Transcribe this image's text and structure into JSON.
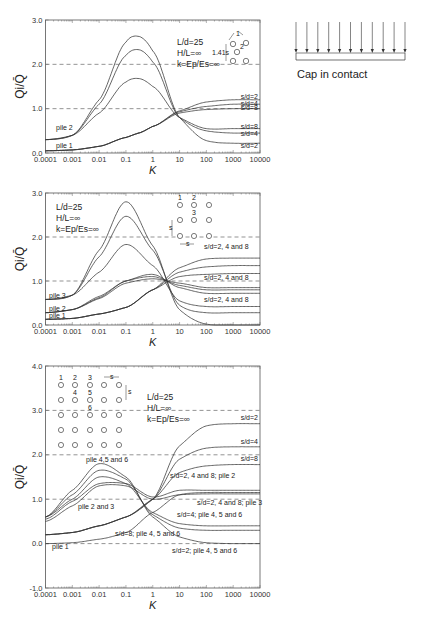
{
  "legend_box": {
    "caption": "Cap in contact"
  },
  "chart_data": [
    {
      "type": "line",
      "panel": "top (3-pile triangular group)",
      "title": "",
      "xlabel": "K",
      "ylabel": "Qi/Q̄",
      "xscale": "log",
      "xlim": [
        0.0001,
        10000
      ],
      "ylim": [
        0.0,
        3.0
      ],
      "x_ticks": [
        "0.0001",
        "0.001",
        "0.01",
        "0.1",
        "1",
        "10",
        "100",
        "1000",
        "10000"
      ],
      "y_ticks": [
        "0.0",
        "1.0",
        "2.0",
        "3.0"
      ],
      "grid": "dashed at 1.0 and 2.0",
      "parameters": [
        "L/d=25",
        "H/L=∞",
        "k=Ep/Es=∞"
      ],
      "diagram_label": "1.41s",
      "annotations": [
        "pile 2",
        "pile 1",
        "s/d=2",
        "s/d=4",
        "s/d=8",
        "s/d=8",
        "s/d=4",
        "s/d=2"
      ],
      "x": [
        0.0001,
        0.001,
        0.01,
        0.1,
        0.3,
        1,
        10,
        100,
        1000,
        10000
      ],
      "series": [
        {
          "name": "pile 2, s/d=2",
          "values": [
            0.3,
            0.4,
            1.2,
            2.5,
            2.63,
            2.3,
            0.8,
            0.28,
            0.22,
            0.22
          ]
        },
        {
          "name": "pile 2, s/d=4",
          "values": [
            0.3,
            0.4,
            1.1,
            2.2,
            2.33,
            2.05,
            0.8,
            0.5,
            0.45,
            0.45
          ]
        },
        {
          "name": "pile 2, s/d=8",
          "values": [
            0.3,
            0.4,
            0.9,
            1.6,
            1.68,
            1.5,
            0.8,
            0.55,
            0.55,
            0.55
          ]
        },
        {
          "name": "pile 1, s/d=2",
          "values": [
            0.05,
            0.07,
            0.15,
            0.35,
            0.45,
            0.6,
            0.95,
            1.15,
            1.2,
            1.2
          ]
        },
        {
          "name": "pile 1, s/d=4",
          "values": [
            0.05,
            0.07,
            0.15,
            0.35,
            0.45,
            0.6,
            0.93,
            1.05,
            1.1,
            1.1
          ]
        },
        {
          "name": "pile 1, s/d=8",
          "values": [
            0.05,
            0.07,
            0.15,
            0.35,
            0.45,
            0.6,
            0.9,
            0.98,
            1.0,
            1.0
          ]
        }
      ]
    },
    {
      "type": "line",
      "panel": "middle (3x3 pile group)",
      "title": "",
      "xlabel": "K",
      "ylabel": "Qi/Q̄",
      "xscale": "log",
      "xlim": [
        0.0001,
        10000
      ],
      "ylim": [
        0.0,
        3.0
      ],
      "x_ticks": [
        "0.0001",
        "0.001",
        "0.01",
        "0.1",
        "1",
        "10",
        "100",
        "1000",
        "10000"
      ],
      "y_ticks": [
        "0.0",
        "1.0",
        "2.0",
        "3.0"
      ],
      "grid": "dashed at 1.0 and 2.0",
      "parameters": [
        "L/d=25",
        "H/L=∞",
        "k=Ep/Es=∞"
      ],
      "diagram_labels": [
        "1",
        "2",
        "3",
        "s",
        "s"
      ],
      "annotations": [
        "pile 3",
        "pile 2",
        "pile 1",
        "s/d=2, 4 and 8",
        "s/d=2, 4 and 8",
        "s/d=2, 4 and 8"
      ],
      "x": [
        0.0001,
        0.001,
        0.01,
        0.1,
        1,
        10,
        100,
        1000,
        10000
      ],
      "series": [
        {
          "name": "pile 3, s/d=2",
          "values": [
            0.58,
            0.68,
            1.7,
            2.8,
            1.8,
            0.35,
            0.02,
            0.0,
            0.0
          ]
        },
        {
          "name": "pile 3, s/d=4",
          "values": [
            0.58,
            0.68,
            1.55,
            2.47,
            1.7,
            0.45,
            0.28,
            0.28,
            0.28
          ]
        },
        {
          "name": "pile 3, s/d=8",
          "values": [
            0.58,
            0.68,
            1.2,
            1.83,
            1.35,
            0.55,
            0.42,
            0.42,
            0.42
          ]
        },
        {
          "name": "pile 2, s/d=2",
          "values": [
            0.28,
            0.35,
            0.65,
            1.0,
            1.15,
            0.85,
            0.72,
            0.72,
            0.72
          ]
        },
        {
          "name": "pile 2, s/d=4",
          "values": [
            0.28,
            0.35,
            0.62,
            1.0,
            1.1,
            0.9,
            0.8,
            0.8,
            0.8
          ]
        },
        {
          "name": "pile 2, s/d=8",
          "values": [
            0.28,
            0.35,
            0.6,
            0.95,
            1.05,
            0.95,
            0.85,
            0.85,
            0.85
          ]
        },
        {
          "name": "pile 1, s/d=2",
          "values": [
            0.13,
            0.15,
            0.25,
            0.4,
            0.8,
            1.3,
            1.5,
            1.52,
            1.52
          ]
        },
        {
          "name": "pile 1, s/d=4",
          "values": [
            0.13,
            0.15,
            0.25,
            0.4,
            0.8,
            1.2,
            1.32,
            1.35,
            1.35
          ]
        },
        {
          "name": "pile 1, s/d=8",
          "values": [
            0.13,
            0.15,
            0.25,
            0.4,
            0.8,
            1.1,
            1.15,
            1.17,
            1.17
          ]
        }
      ]
    },
    {
      "type": "line",
      "panel": "bottom (5x5 pile group)",
      "title": "",
      "xlabel": "K",
      "ylabel": "Qi/Q̄",
      "xscale": "log",
      "xlim": [
        0.0001,
        10000
      ],
      "ylim": [
        -1.0,
        4.0
      ],
      "x_ticks": [
        "0.0001",
        "0.001",
        "0.01",
        "0.1",
        "1",
        "10",
        "100",
        "1000",
        "10000"
      ],
      "y_ticks": [
        "-1.0",
        "0.0",
        "1.0",
        "2.0",
        "3.0",
        "4.0"
      ],
      "grid": "dashed at 0.0, 1.0, 2.0 and 3.0",
      "parameters": [
        "L/d=25",
        "H/L=∞",
        "k=Ep/Es=∞"
      ],
      "diagram_labels": [
        "1",
        "2",
        "3",
        "4",
        "5",
        "6",
        "s",
        "s"
      ],
      "annotations": [
        "pile 4,5 and 6",
        "pile 2 and 3",
        "pile 1",
        "s/d=2",
        "s/d=4",
        "s/d=8",
        "s/d=2, 4 and 8; pile 2",
        "s/d=2, 4 and 8; pile 3",
        "s/d=4; pile 4, 5 and 6",
        "s/d=8; pile 4, 5 and 6",
        "s/d=2; pile 4, 5 and 6"
      ],
      "x": [
        0.0001,
        0.001,
        0.01,
        0.1,
        1,
        10,
        100,
        1000,
        10000
      ],
      "series": [
        {
          "name": "pile 1, s/d=2",
          "values": [
            0.2,
            0.25,
            0.4,
            0.6,
            1.0,
            2.2,
            2.65,
            2.7,
            2.7
          ]
        },
        {
          "name": "pile 1, s/d=4",
          "values": [
            0.2,
            0.25,
            0.4,
            0.6,
            1.0,
            1.9,
            2.15,
            2.18,
            2.18
          ]
        },
        {
          "name": "pile 1, s/d=8",
          "values": [
            0.2,
            0.25,
            0.4,
            0.6,
            1.0,
            1.6,
            1.75,
            1.78,
            1.78
          ]
        },
        {
          "name": "pile 2, s/d=2/4/8",
          "values": [
            0.55,
            0.95,
            1.35,
            1.35,
            1.05,
            1.2,
            1.2,
            1.2,
            1.2
          ]
        },
        {
          "name": "pile 3, s/d=2/4/8",
          "values": [
            0.5,
            0.85,
            1.3,
            1.3,
            1.0,
            1.1,
            1.12,
            1.12,
            1.12
          ]
        },
        {
          "name": "pile 4,5,6, s/d=2",
          "values": [
            0.6,
            1.2,
            1.8,
            1.5,
            0.6,
            0.15,
            0.02,
            0.0,
            0.0
          ]
        },
        {
          "name": "pile 4,5,6, s/d=4",
          "values": [
            0.6,
            1.1,
            1.65,
            1.45,
            0.65,
            0.35,
            0.3,
            0.3,
            0.3
          ]
        },
        {
          "name": "pile 4,5,6, s/d=8",
          "values": [
            0.6,
            1.0,
            1.5,
            1.35,
            0.7,
            0.45,
            0.4,
            0.4,
            0.4
          ]
        },
        {
          "name": "pile 1 (low)",
          "values": [
            0.0,
            0.02,
            0.1,
            0.25,
            0.7,
            1.1,
            1.15,
            1.15,
            1.15
          ]
        }
      ]
    }
  ]
}
